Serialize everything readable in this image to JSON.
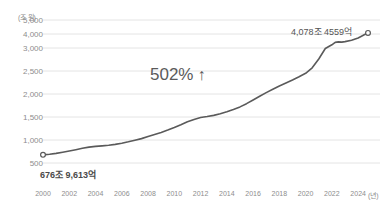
{
  "chart_data": {
    "type": "line",
    "title": "",
    "xlabel": "(년)",
    "ylabel": "(조 원)",
    "y_unit_label": "(조 원)",
    "x_unit_label": "(년)",
    "yticks": [
      500,
      1000,
      1500,
      2000,
      2500,
      3000,
      4000,
      5000
    ],
    "ytick_labels": [
      "500",
      "1,000",
      "1,500",
      "2,000",
      "2,500",
      "3,000",
      "4,000",
      "5,000"
    ],
    "ytick_y_px": [
      163,
      140,
      117,
      94,
      71,
      48,
      34,
      20
    ],
    "xticks": [
      2000,
      2002,
      2004,
      2006,
      2008,
      2010,
      2012,
      2014,
      2016,
      2018,
      2020,
      2022,
      2024
    ],
    "xtick_labels": [
      "2000",
      "2002",
      "2004",
      "2006",
      "2008",
      "2010",
      "2012",
      "2014",
      "2016",
      "2018",
      "2020",
      "2022",
      "2024"
    ],
    "xlim": [
      2000,
      2024.75
    ],
    "ylim": [
      400,
      5000
    ],
    "grid": true,
    "legend": false,
    "line_color": "#5a5a5a",
    "grid_color": "#e4e4e4",
    "text_color": "#8d8d8d",
    "series": [
      {
        "name": "가계부채",
        "x": [
          2000.0,
          2000.5,
          2001.0,
          2001.5,
          2002.0,
          2002.5,
          2003.0,
          2003.5,
          2004.0,
          2004.5,
          2005.0,
          2005.5,
          2006.0,
          2006.5,
          2007.0,
          2007.5,
          2008.0,
          2008.5,
          2009.0,
          2009.5,
          2010.0,
          2010.5,
          2011.0,
          2011.5,
          2012.0,
          2012.5,
          2013.0,
          2013.5,
          2014.0,
          2014.5,
          2015.0,
          2015.5,
          2016.0,
          2016.5,
          2017.0,
          2017.5,
          2018.0,
          2018.5,
          2019.0,
          2019.5,
          2020.0,
          2020.5,
          2021.0,
          2021.5,
          2022.0,
          2022.25,
          2022.5,
          2022.75,
          2023.0,
          2023.5,
          2024.0,
          2024.5,
          2024.75
        ],
        "values": [
          676.96,
          690,
          710,
          735,
          762,
          790,
          820,
          845,
          862,
          872,
          885,
          905,
          930,
          960,
          995,
          1030,
          1075,
          1120,
          1165,
          1215,
          1270,
          1330,
          1395,
          1445,
          1490,
          1510,
          1535,
          1570,
          1615,
          1665,
          1720,
          1790,
          1870,
          1950,
          2030,
          2105,
          2175,
          2240,
          2305,
          2375,
          2450,
          2570,
          2760,
          2990,
          3230,
          3400,
          3440,
          3420,
          3455,
          3560,
          3720,
          3960,
          4078.46
        ]
      }
    ],
    "markers": [
      {
        "name": "start-marker",
        "x": 2000.0,
        "y": 676.96
      },
      {
        "name": "end-marker",
        "x": 2024.75,
        "y": 4078.46
      }
    ],
    "annotations": [
      {
        "name": "start-value",
        "text": "676조 9,613억"
      },
      {
        "name": "end-value",
        "text": "4,078조 4559억"
      },
      {
        "name": "growth-rate",
        "text": "502%",
        "arrow": "↑"
      }
    ]
  },
  "annotations": {
    "start_value": "676조 9,613억",
    "end_value": "4,078조 4559억",
    "growth_value": "502%",
    "growth_arrow": "↑"
  },
  "axes": {
    "y_unit": "(조 원)",
    "x_unit": "(년)"
  }
}
